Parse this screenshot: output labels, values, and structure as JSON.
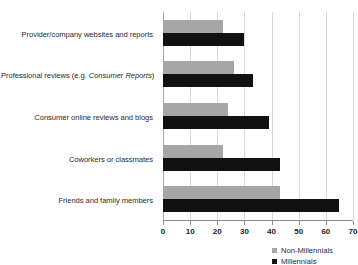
{
  "chart_data": {
    "type": "bar",
    "orientation": "horizontal",
    "title": "",
    "subtitle": "",
    "xlabel": "",
    "ylabel": "",
    "xlim": [
      0,
      70
    ],
    "xticks": [
      0,
      10,
      20,
      30,
      40,
      50,
      60,
      70
    ],
    "xtick_labels": [
      "0",
      "10",
      "20",
      "30",
      "40",
      "50",
      "60",
      "70"
    ],
    "grid": true,
    "grid_axis": "x",
    "legend_position": "bottom-right",
    "categories": [
      "Provider/company websites and reports",
      "Professional reviews (e.g. Consumer Reports)",
      "Consumer online reviews and blogs",
      "Coworkers or classmates",
      "Friends and family members"
    ],
    "categories_rich": [
      {
        "pre": "Provider/company websites and reports",
        "italic": "",
        "post": ""
      },
      {
        "pre": "Professional reviews (e.g. ",
        "italic": "Consumer Reports",
        "post": ")"
      },
      {
        "pre": "Consumer online reviews and blogs",
        "italic": "",
        "post": ""
      },
      {
        "pre": "Coworkers or classmates",
        "italic": "",
        "post": ""
      },
      {
        "pre": "Friends and family members",
        "italic": "",
        "post": ""
      }
    ],
    "series": [
      {
        "name": "Non-Millennials",
        "color": "#a6a6a6",
        "values": [
          22,
          26,
          24,
          22,
          43
        ]
      },
      {
        "name": "Millennials",
        "color": "#111111",
        "values": [
          30,
          33,
          39,
          43,
          65
        ]
      }
    ]
  },
  "legend": {
    "items": [
      {
        "label": "Non-Millennials",
        "color": "#a6a6a6"
      },
      {
        "label": "Millennials",
        "color": "#111111"
      }
    ]
  }
}
